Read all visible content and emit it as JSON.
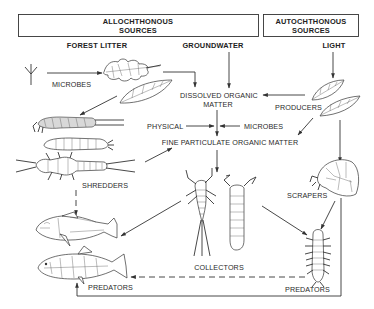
{
  "diagram": {
    "title_boxes": [
      {
        "id": "allochthonous",
        "line1": "ALLOCHTHONOUS",
        "line2": "SOURCES"
      },
      {
        "id": "autochthonous",
        "line1": "AUTOCHTHONOUS",
        "line2": "SOURCES"
      }
    ],
    "sources": {
      "forest_litter": "FOREST LITTER",
      "groundwater": "GROUNDWATER",
      "light": "LIGHT"
    },
    "nodes": {
      "microbes_top": "MICROBES",
      "dom_line1": "DISSOLVED ORGANIC",
      "dom_line2": "MATTER",
      "producers": "PRODUCERS",
      "physical": "PHYSICAL",
      "microbes_mid": "MICROBES",
      "fpom": "FINE PARTICULATE ORGANIC MATTER",
      "shredders": "SHREDDERS",
      "collectors": "COLLECTORS",
      "scrapers": "SCRAPERS",
      "predators_fish": "PREDATORS",
      "predators_insect": "PREDATORS"
    },
    "edges": [
      {
        "from": "Forest litter (twig)",
        "to": "Leaves",
        "label": "MICROBES",
        "style": "solid"
      },
      {
        "from": "Leaves",
        "to": "Dissolved Organic Matter",
        "style": "solid"
      },
      {
        "from": "Groundwater",
        "to": "Dissolved Organic Matter",
        "style": "solid"
      },
      {
        "from": "Light",
        "to": "Producers",
        "style": "solid"
      },
      {
        "from": "Producers",
        "to": "Dissolved Organic Matter",
        "style": "solid"
      },
      {
        "from": "Dissolved Organic Matter",
        "to": "Fine Particulate Organic Matter",
        "style": "solid"
      },
      {
        "from": "Physical",
        "to": "Fine Particulate Organic Matter",
        "style": "solid"
      },
      {
        "from": "Microbes",
        "to": "Fine Particulate Organic Matter",
        "style": "solid"
      },
      {
        "from": "Producers",
        "to": "Fine Particulate Organic Matter",
        "style": "solid"
      },
      {
        "from": "Leaves",
        "to": "Shredders",
        "style": "solid"
      },
      {
        "from": "Shredders",
        "to": "Fine Particulate Organic Matter",
        "style": "solid"
      },
      {
        "from": "Fine Particulate Organic Matter",
        "to": "Collectors",
        "style": "solid"
      },
      {
        "from": "Shredders",
        "to": "Fish (predator)",
        "style": "dashed"
      },
      {
        "from": "Collectors",
        "to": "Fish (predator)",
        "style": "solid"
      },
      {
        "from": "Collectors",
        "to": "Insect Predators",
        "style": "solid"
      },
      {
        "from": "Producers",
        "to": "Scrapers",
        "style": "solid"
      },
      {
        "from": "Scrapers",
        "to": "Insect Predators",
        "style": "solid"
      },
      {
        "from": "Insect Predators",
        "to": "Fish Predators",
        "style": "dashed"
      },
      {
        "from": "Scrapers",
        "to": "Fish Predators",
        "style": "solid"
      }
    ]
  }
}
